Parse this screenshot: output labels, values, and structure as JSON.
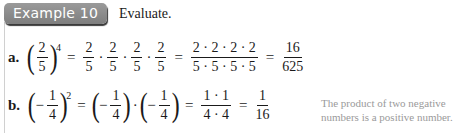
{
  "header": {
    "badge": "Example 10",
    "instruction": "Evaluate."
  },
  "parts": [
    {
      "label": "a.",
      "base": {
        "num": "2",
        "den": "5"
      },
      "exponent": "4",
      "expanded": [
        {
          "num": "2",
          "den": "5"
        },
        {
          "num": "2",
          "den": "5"
        },
        {
          "num": "2",
          "den": "5"
        },
        {
          "num": "2",
          "den": "5"
        }
      ],
      "product": {
        "num": "2 · 2 · 2 · 2",
        "den": "5 · 5 · 5 · 5"
      },
      "result": {
        "num": "16",
        "den": "625"
      },
      "equals": "="
    },
    {
      "label": "b.",
      "base": {
        "sign": "−",
        "num": "1",
        "den": "4"
      },
      "exponent": "2",
      "expanded": [
        {
          "sign": "−",
          "num": "1",
          "den": "4"
        },
        {
          "sign": "−",
          "num": "1",
          "den": "4"
        }
      ],
      "product": {
        "num": "1 · 1",
        "den": "4 · 4"
      },
      "result": {
        "num": "1",
        "den": "16"
      },
      "equals": "=",
      "note": "The product of two negative numbers is a positive number."
    }
  ],
  "symbols": {
    "dot": "·",
    "lparen": "(",
    "rparen": ")"
  }
}
